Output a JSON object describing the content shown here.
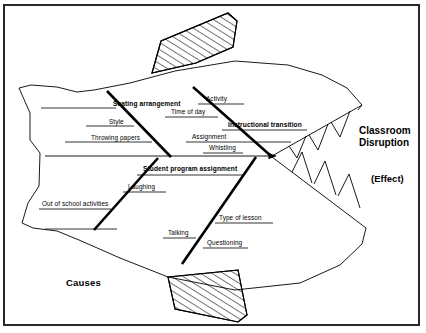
{
  "diagram": {
    "type": "fishbone-ishikawa",
    "title_effect": "Classroom Disruption",
    "effect_note": "(Effect)",
    "causes_heading": "Causes",
    "branches": [
      {
        "id": "seating-arrangement",
        "label": "Seating arrangement",
        "position": "upper-left",
        "causes": [
          "Style",
          "Throwing papers"
        ]
      },
      {
        "id": "instructional-transition",
        "label": "Instructional transition",
        "position": "upper-right",
        "causes": [
          "Activity",
          "Time of day",
          "Assignment",
          "Whistling"
        ]
      },
      {
        "id": "student-program-assignment",
        "label": "Student program assignment",
        "position": "lower-left",
        "causes": [
          "Out of school activities",
          "Laughing"
        ]
      },
      {
        "id": "lower-right-branch",
        "label": "",
        "position": "lower-right",
        "causes": [
          "Type of lesson",
          "Talking",
          "Questioning"
        ]
      }
    ],
    "causes_flat": [
      "Seating arrangement",
      "Style",
      "Throwing papers",
      "Activity",
      "Time of day",
      "Instructional transition",
      "Assignment",
      "Whistling",
      "Student program assignment",
      "Laughing",
      "Out of school activities",
      "Type of lesson",
      "Talking",
      "Questioning"
    ],
    "shape_notes": {
      "body": "fish-body-outline",
      "top_fin": "hatched-dorsal-fin",
      "bottom_fin": "hatched-ventral-fin",
      "mouth": "toothed-mouth",
      "spine": "horizontal-arrow-spine"
    }
  },
  "colors": {
    "ink": "#000000",
    "border": "#2a2a2a",
    "background": "#ffffff"
  }
}
